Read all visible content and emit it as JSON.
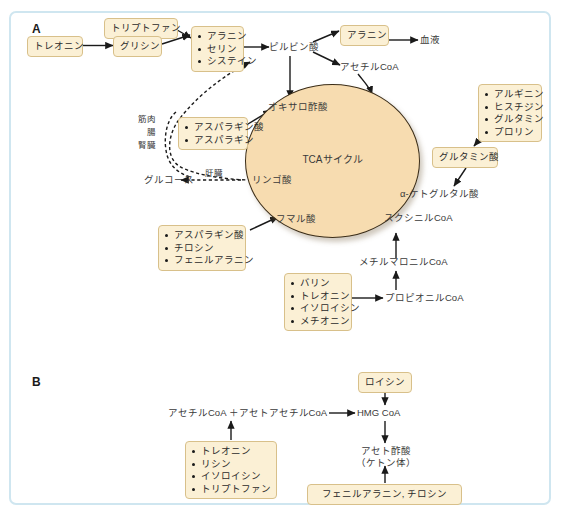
{
  "figure": {
    "panel_a_letter": "A",
    "panel_b_letter": "B"
  },
  "panel_a": {
    "boxes": {
      "threonine": "トレオニン",
      "tryptophan": "トリプトファン",
      "glycine": "グリシン",
      "ala_ser_cys": [
        "アラニン",
        "セリン",
        "システイン"
      ],
      "alanine": "アラニン",
      "asp_asn": [
        "アスパラギン酸",
        "アスパラギン"
      ],
      "arg_his_gln_pro": [
        "アルギニン",
        "ヒスチジン",
        "グルタミン",
        "プロリン"
      ],
      "glutamate": "グルタミン酸",
      "asp_tyr_phe": [
        "アスパラギン酸",
        "チロシン",
        "フェニルアラニン"
      ],
      "val_thr_ile_met": [
        "バリン",
        "トレオニン",
        "イソロイシン",
        "メチオニン"
      ]
    },
    "labels": {
      "pyruvate": "ピルビン酸",
      "blood": "血液",
      "acetyl_coa": "アセチルCoA",
      "oxaloacetate": "オキサロ酢酸",
      "tca_cycle": "TCAサイクル",
      "alpha_ketoglutarate": "α-ケトグルタル酸",
      "succinyl_coa": "スクシニルCoA",
      "methylmalonyl_coa": "メチルマロニルCoA",
      "propionyl_coa": "プロピオニルCoA",
      "fumarate": "フマル酸",
      "malate": "リンゴ酸",
      "glucose": "グルコース",
      "liver": "肝臓",
      "tissues_line1": "筋肉",
      "tissues_line2": "腸",
      "tissues_line3": "腎臓"
    }
  },
  "panel_b": {
    "boxes": {
      "leucine": "ロイシン",
      "thr_lys_ile_trp": [
        "トレオニン",
        "リシン",
        "イソロイシン",
        "トリプトファン"
      ],
      "phe_tyr": "フェニルアラニン, チロシン"
    },
    "labels": {
      "acetyl_acetoacetyl": "アセチルCoA ＋アセトアセチルCoA",
      "hmg_coa": "HMG CoA",
      "acetoacetate_line1": "アセト酢酸",
      "acetoacetate_line2": "（ケトン体）"
    }
  },
  "colors": {
    "frame_border": "#cfe6f0",
    "box_fill": "#fbf0d5",
    "box_border": "#d8c08a",
    "circle_fill": "#f7dcb0",
    "circle_border": "#3b2d18",
    "arrow": "#1a1a1a",
    "text": "#3a3a3a",
    "background": "#ffffff"
  }
}
